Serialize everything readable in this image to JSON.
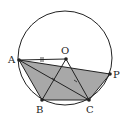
{
  "diagram": {
    "type": "geometry",
    "circle": {
      "cx": 65,
      "cy": 58,
      "r": 47
    },
    "points": {
      "A": {
        "label": "A",
        "x": 19,
        "y": 60
      },
      "O": {
        "label": "O",
        "x": 66,
        "y": 59
      },
      "P": {
        "label": "P",
        "x": 110,
        "y": 74
      },
      "B": {
        "label": "B",
        "x": 42,
        "y": 100
      },
      "C": {
        "label": "C",
        "x": 89,
        "y": 100
      }
    },
    "shaded_region": [
      "A",
      "P",
      "C",
      "B"
    ],
    "segments": [
      [
        "A",
        "O"
      ],
      [
        "A",
        "C"
      ],
      [
        "A",
        "P"
      ],
      [
        "O",
        "B"
      ],
      [
        "O",
        "C"
      ],
      [
        "B",
        "C"
      ],
      [
        "P",
        "C"
      ],
      [
        "A",
        "B"
      ]
    ],
    "marks": {
      "AO_tick": "double-tick",
      "angle_marks": 2
    },
    "colors": {
      "line": "#222222",
      "shade": "#a8a8a8",
      "background": "#ffffff"
    }
  }
}
